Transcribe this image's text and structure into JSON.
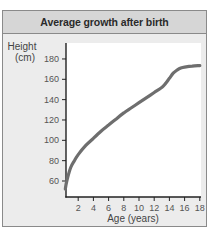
{
  "chart_data": {
    "type": "line",
    "title": "Average growth after birth",
    "xlabel": "Age (years)",
    "ylabel": "Height (cm)",
    "ylabel_lines": [
      "Height",
      "(cm)"
    ],
    "xlim": [
      0,
      18.5
    ],
    "ylim": [
      50,
      190
    ],
    "x_ticks": [
      2,
      4,
      6,
      8,
      10,
      12,
      14,
      16,
      18
    ],
    "y_ticks": [
      60,
      80,
      100,
      120,
      140,
      160,
      180
    ],
    "grid": false,
    "legend": null,
    "series": [
      {
        "name": "Average height",
        "color": "#6e6e6e",
        "x": [
          0.3,
          0.5,
          1,
          1.5,
          2,
          3,
          4,
          5,
          6,
          7,
          8,
          9,
          10,
          11,
          12,
          13,
          13.5,
          14,
          14.5,
          15,
          15.5,
          16,
          17,
          18
        ],
        "y": [
          52,
          60,
          73,
          80,
          86,
          95,
          102,
          109,
          115,
          121,
          127,
          132,
          137,
          142,
          147,
          152,
          156,
          161,
          166,
          169,
          171,
          172,
          173,
          173.5
        ]
      }
    ]
  },
  "colors": {
    "frame_bg": "#ececec",
    "header_bg": "#d6d6d6",
    "plot_bg": "#ffffff",
    "line": "#6e6e6e",
    "axis": "#222222"
  }
}
